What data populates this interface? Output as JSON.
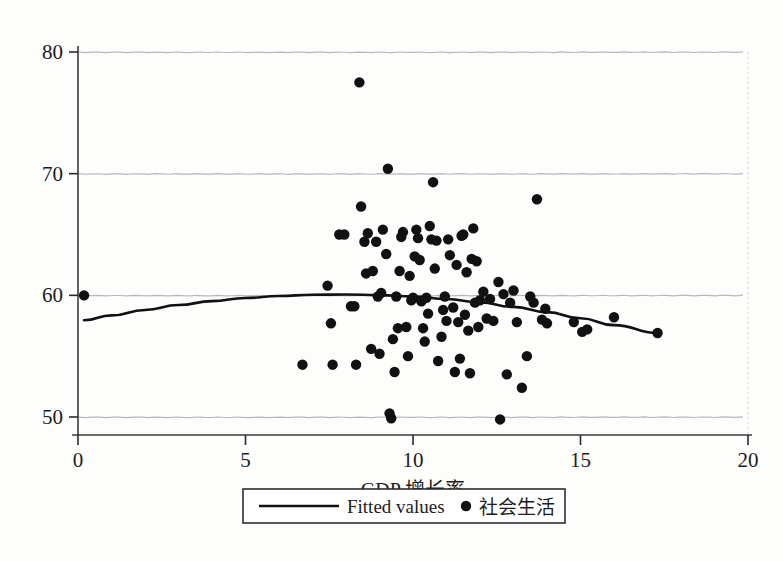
{
  "chart_data": {
    "type": "scatter",
    "title": "",
    "subtitle": "",
    "xlabel": "GDP 增长率",
    "ylabel": "",
    "xlim": [
      0,
      20
    ],
    "ylim": [
      48.8,
      80.8
    ],
    "xticks": [
      "0",
      "5",
      "10",
      "15",
      "20"
    ],
    "xtick_values": [
      0,
      5,
      10,
      15,
      20
    ],
    "yticks": [
      "50",
      "60",
      "70",
      "80"
    ],
    "ytick_values": [
      50,
      60,
      70,
      80
    ],
    "grid": "horizontal-only",
    "grid_color": "#b9b9b9",
    "point_color": "#111111",
    "line_color": "#111111",
    "background_color": "#fdfdfc",
    "legend": {
      "position": "below-axis-centered",
      "entries": [
        {
          "label": "Fitted values",
          "marker": "line",
          "script": "latin"
        },
        {
          "label": "社会生活",
          "marker": "circle",
          "script": "cjk"
        }
      ]
    },
    "series": [
      {
        "name": "社会生活",
        "marker": "circle",
        "points": [
          [
            0.18,
            60.0
          ],
          [
            6.7,
            54.3
          ],
          [
            7.45,
            60.8
          ],
          [
            7.55,
            57.7
          ],
          [
            7.6,
            54.3
          ],
          [
            7.8,
            65.0
          ],
          [
            7.95,
            65.0
          ],
          [
            8.15,
            59.1
          ],
          [
            8.25,
            59.1
          ],
          [
            8.3,
            54.3
          ],
          [
            8.4,
            77.5
          ],
          [
            8.45,
            67.3
          ],
          [
            8.55,
            64.4
          ],
          [
            8.6,
            61.8
          ],
          [
            8.65,
            65.1
          ],
          [
            8.75,
            55.6
          ],
          [
            8.8,
            62.0
          ],
          [
            8.9,
            64.4
          ],
          [
            8.95,
            59.9
          ],
          [
            9.0,
            55.2
          ],
          [
            9.05,
            60.2
          ],
          [
            9.1,
            65.4
          ],
          [
            9.2,
            63.4
          ],
          [
            9.25,
            70.4
          ],
          [
            9.3,
            50.3
          ],
          [
            9.35,
            49.9
          ],
          [
            9.4,
            56.4
          ],
          [
            9.45,
            53.7
          ],
          [
            9.5,
            59.9
          ],
          [
            9.55,
            57.3
          ],
          [
            9.6,
            62.0
          ],
          [
            9.65,
            64.8
          ],
          [
            9.7,
            65.2
          ],
          [
            9.8,
            57.4
          ],
          [
            9.85,
            55.0
          ],
          [
            9.9,
            61.6
          ],
          [
            9.95,
            59.6
          ],
          [
            10.0,
            59.8
          ],
          [
            10.05,
            63.2
          ],
          [
            10.1,
            65.4
          ],
          [
            10.15,
            64.7
          ],
          [
            10.2,
            62.9
          ],
          [
            10.25,
            59.5
          ],
          [
            10.3,
            57.3
          ],
          [
            10.35,
            56.2
          ],
          [
            10.4,
            59.8
          ],
          [
            10.45,
            58.5
          ],
          [
            10.5,
            65.7
          ],
          [
            10.55,
            64.6
          ],
          [
            10.6,
            69.3
          ],
          [
            10.65,
            62.2
          ],
          [
            10.7,
            64.5
          ],
          [
            10.75,
            54.6
          ],
          [
            10.85,
            56.6
          ],
          [
            10.9,
            58.8
          ],
          [
            10.95,
            59.9
          ],
          [
            11.0,
            57.9
          ],
          [
            11.05,
            64.6
          ],
          [
            11.1,
            63.3
          ],
          [
            11.2,
            59.0
          ],
          [
            11.25,
            53.7
          ],
          [
            11.3,
            62.5
          ],
          [
            11.35,
            57.8
          ],
          [
            11.4,
            54.8
          ],
          [
            11.45,
            64.9
          ],
          [
            11.5,
            65.0
          ],
          [
            11.55,
            58.4
          ],
          [
            11.6,
            61.9
          ],
          [
            11.65,
            57.1
          ],
          [
            11.7,
            53.6
          ],
          [
            11.75,
            63.0
          ],
          [
            11.8,
            65.5
          ],
          [
            11.85,
            59.4
          ],
          [
            11.9,
            62.8
          ],
          [
            11.95,
            57.4
          ],
          [
            12.0,
            59.6
          ],
          [
            12.1,
            60.3
          ],
          [
            12.2,
            58.1
          ],
          [
            12.3,
            59.7
          ],
          [
            12.4,
            57.9
          ],
          [
            12.55,
            61.1
          ],
          [
            12.6,
            49.8
          ],
          [
            12.7,
            60.1
          ],
          [
            12.8,
            53.5
          ],
          [
            12.9,
            59.4
          ],
          [
            13.0,
            60.4
          ],
          [
            13.1,
            57.8
          ],
          [
            13.25,
            52.4
          ],
          [
            13.4,
            55.0
          ],
          [
            13.5,
            59.9
          ],
          [
            13.6,
            59.4
          ],
          [
            13.7,
            67.9
          ],
          [
            13.85,
            58.0
          ],
          [
            13.95,
            58.9
          ],
          [
            14.0,
            57.7
          ],
          [
            14.8,
            57.8
          ],
          [
            15.05,
            57.0
          ],
          [
            15.2,
            57.2
          ],
          [
            16.0,
            58.2
          ],
          [
            17.3,
            56.9
          ]
        ]
      }
    ],
    "fitted": {
      "name": "Fitted values",
      "form": "quadratic",
      "x_range": [
        0.18,
        17.3
      ],
      "points": [
        [
          0.18,
          57.95
        ],
        [
          1.0,
          58.35
        ],
        [
          2.0,
          58.8
        ],
        [
          3.0,
          59.2
        ],
        [
          4.0,
          59.52
        ],
        [
          5.0,
          59.78
        ],
        [
          6.0,
          59.95
        ],
        [
          7.0,
          60.05
        ],
        [
          8.0,
          60.07
        ],
        [
          9.0,
          60.02
        ],
        [
          10.0,
          59.9
        ],
        [
          11.0,
          59.7
        ],
        [
          12.0,
          59.42
        ],
        [
          13.0,
          59.05
        ],
        [
          14.0,
          58.62
        ],
        [
          15.0,
          58.12
        ],
        [
          16.0,
          57.55
        ],
        [
          17.3,
          56.9
        ]
      ]
    }
  }
}
